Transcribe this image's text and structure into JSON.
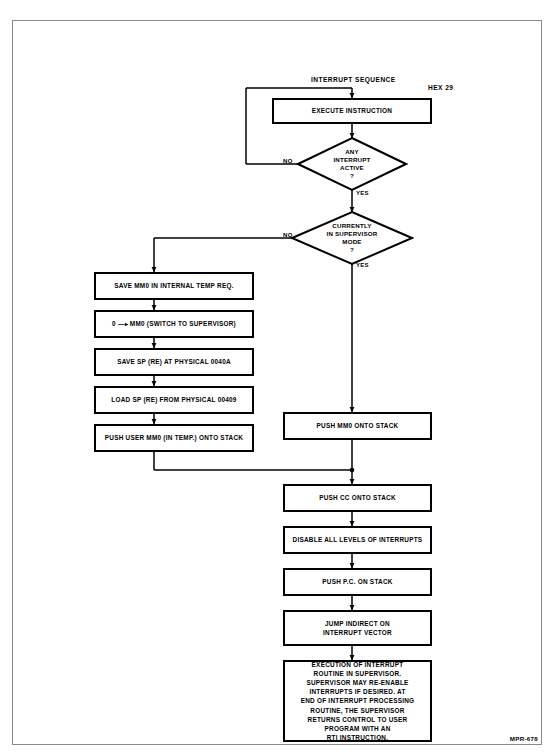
{
  "page": {
    "title": "INTERRUPT SEQUENCE",
    "figure_code": "HEX 29",
    "plate_code": "MPR-678"
  },
  "flowchart": {
    "type": "flowchart",
    "orientation": "top-to-bottom",
    "nodes": [
      {
        "id": "execute",
        "shape": "process",
        "text": "EXECUTE INSTRUCTION"
      },
      {
        "id": "any_interrupt",
        "shape": "decision",
        "text": "ANY\nINTERRUPT\nACTIVE\n?"
      },
      {
        "id": "supervisor",
        "shape": "decision",
        "text": "CURRENTLY\nIN SUPERVISOR\nMODE\n?"
      },
      {
        "id": "save_mm0_temp",
        "shape": "process",
        "text": "SAVE MM0 IN INTERNAL TEMP REQ."
      },
      {
        "id": "zero_to_mm0",
        "shape": "process",
        "text": "0 —▸ MM0 (SWITCH TO SUPERVISOR)"
      },
      {
        "id": "save_sp",
        "shape": "process",
        "text": "SAVE SP (RE) AT PHYSICAL 0040A"
      },
      {
        "id": "load_sp",
        "shape": "process",
        "text": "LOAD SP (RE) FROM PHYSICAL 00409"
      },
      {
        "id": "push_user_mm0",
        "shape": "process",
        "text": "PUSH USER MM0 (IN TEMP.) ONTO STACK"
      },
      {
        "id": "push_mm0",
        "shape": "process",
        "text": "PUSH MM0 ONTO STACK"
      },
      {
        "id": "push_cc",
        "shape": "process",
        "text": "PUSH CC ONTO STACK"
      },
      {
        "id": "disable_int",
        "shape": "process",
        "text": "DISABLE ALL LEVELS OF INTERRUPTS"
      },
      {
        "id": "push_pc",
        "shape": "process",
        "text": "PUSH P.C. ON STACK"
      },
      {
        "id": "jump_indirect",
        "shape": "process",
        "text": "JUMP INDIRECT ON\nINTERRUPT VECTOR"
      },
      {
        "id": "exec_routine",
        "shape": "process",
        "text": "EXECUTION OF INTERRUPT\nROUTINE IN SUPERVISOR.\nSUPERVISOR MAY RE-ENABLE\nINTERRUPTS IF DESIRED. AT\nEND OF INTERRUPT PROCESSING\nROUTINE, THE SUPERVISOR\nRETURNS CONTROL TO USER\nPROGRAM WITH AN\nRTI INSTRUCTION."
      }
    ],
    "edge_labels": {
      "any_interrupt_no": "NO",
      "any_interrupt_yes": "YES",
      "supervisor_no": "NO",
      "supervisor_yes": "YES"
    },
    "edges": [
      {
        "from": "execute",
        "to": "any_interrupt"
      },
      {
        "from": "any_interrupt",
        "to": "execute",
        "label": "NO"
      },
      {
        "from": "any_interrupt",
        "to": "supervisor",
        "label": "YES"
      },
      {
        "from": "supervisor",
        "to": "save_mm0_temp",
        "label": "NO"
      },
      {
        "from": "supervisor",
        "to": "push_mm0",
        "label": "YES"
      },
      {
        "from": "save_mm0_temp",
        "to": "zero_to_mm0"
      },
      {
        "from": "zero_to_mm0",
        "to": "save_sp"
      },
      {
        "from": "save_sp",
        "to": "load_sp"
      },
      {
        "from": "load_sp",
        "to": "push_user_mm0"
      },
      {
        "from": "push_user_mm0",
        "to": "push_cc"
      },
      {
        "from": "push_mm0",
        "to": "push_cc"
      },
      {
        "from": "push_cc",
        "to": "disable_int"
      },
      {
        "from": "disable_int",
        "to": "push_pc"
      },
      {
        "from": "push_pc",
        "to": "jump_indirect"
      },
      {
        "from": "jump_indirect",
        "to": "exec_routine"
      }
    ]
  },
  "colors": {
    "ink": "#000000",
    "paper": "#ffffff",
    "frame": "#8a8a8a"
  }
}
